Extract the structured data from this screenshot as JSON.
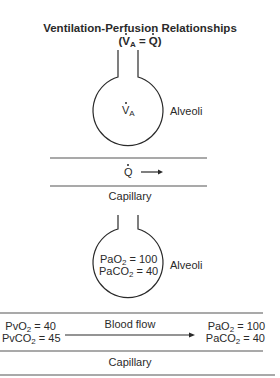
{
  "title": {
    "line1": "Ventilation-Perfusion Relationships",
    "line2_prefix": "(",
    "line2_v": "V",
    "line2_v_sub": "A",
    "line2_eq": " = ",
    "line2_q": "Q",
    "line2_suffix": ")"
  },
  "top_panel": {
    "alveolus_symbol": "V",
    "alveolus_symbol_sub": "A",
    "alveoli_label": "Alveoli",
    "flow_symbol": "Q",
    "capillary_label": "Capillary"
  },
  "bottom_panel": {
    "alveolus_values": [
      {
        "name": "PaO",
        "sub": "2",
        "value": " = 100"
      },
      {
        "name": "PaCO",
        "sub": "2",
        "value": " = 40"
      }
    ],
    "alveoli_label": "Alveoli",
    "venous_values": [
      {
        "name": "PvO",
        "sub": "2",
        "value": " = 40"
      },
      {
        "name": "PvCO",
        "sub": "2",
        "value": " = 45"
      }
    ],
    "flow_label": "Blood flow",
    "arterial_values": [
      {
        "name": "PaO",
        "sub": "2",
        "value": " = 100"
      },
      {
        "name": "PaCO",
        "sub": "2",
        "value": " = 40"
      }
    ],
    "capillary_label": "Capillary"
  },
  "colors": {
    "line": "#2a2a2a",
    "rule": "#555555",
    "background": "#ffffff"
  }
}
